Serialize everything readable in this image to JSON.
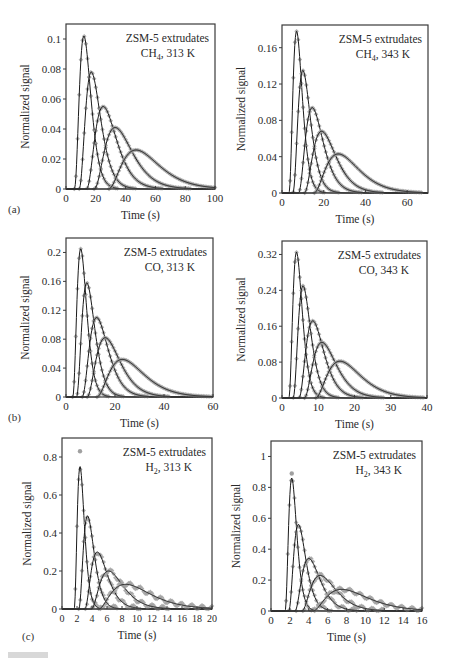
{
  "figure": {
    "panel_labels": [
      "(a)",
      "(b)",
      "(c)"
    ]
  },
  "chart_data": [
    {
      "id": "a-left",
      "type": "line",
      "title": "ZSM-5 extrudates",
      "subtitle": "CH4, 313 K",
      "subtitle_sub": "4",
      "subtitle_gas": "CH",
      "subtitle_temp": ", 313 K",
      "xlabel": "Time (s)",
      "ylabel": "Normalized signal",
      "xlim": [
        0,
        100
      ],
      "ylim": [
        0,
        0.11
      ],
      "xticks": [
        0,
        20,
        40,
        60,
        80,
        100
      ],
      "yticks": [
        0,
        0.02,
        0.04,
        0.06,
        0.08,
        0.1
      ],
      "ytick_labels": [
        "0",
        "0.02",
        "0.04",
        "0.06",
        "0.08",
        "0.1"
      ],
      "series_style": "markers (gray diamonds) = experiment, black line = model fit",
      "series": [
        {
          "name": "curve 1",
          "peak_x": 12,
          "peak_y": 0.102,
          "width": 4.5,
          "skew": 1.2
        },
        {
          "name": "curve 2",
          "peak_x": 17,
          "peak_y": 0.078,
          "width": 6,
          "skew": 1.3
        },
        {
          "name": "curve 3",
          "peak_x": 25,
          "peak_y": 0.055,
          "width": 8.5,
          "skew": 1.4
        },
        {
          "name": "curve 4",
          "peak_x": 33,
          "peak_y": 0.041,
          "width": 11,
          "skew": 1.5
        },
        {
          "name": "curve 5",
          "peak_x": 47,
          "peak_y": 0.026,
          "width": 15,
          "skew": 1.6
        }
      ],
      "frame": {
        "left": 66,
        "top": 24,
        "right": 215,
        "bottom": 189
      }
    },
    {
      "id": "a-right",
      "type": "line",
      "title": "ZSM-5 extrudates",
      "subtitle": "CH4, 343 K",
      "subtitle_sub": "4",
      "subtitle_gas": "CH",
      "subtitle_temp": ", 343 K",
      "xlabel": "Time (s)",
      "ylabel": "Normalized signal",
      "xlim": [
        0,
        70
      ],
      "ylim": [
        0,
        0.185
      ],
      "xticks": [
        0,
        20,
        40,
        60
      ],
      "yticks": [
        0,
        0.04,
        0.08,
        0.12,
        0.16
      ],
      "ytick_labels": [
        "0",
        "0.04",
        "0.08",
        "0.12",
        "0.16"
      ],
      "series": [
        {
          "name": "curve 1",
          "peak_x": 7,
          "peak_y": 0.178,
          "width": 2.6,
          "skew": 1.2
        },
        {
          "name": "curve 2",
          "peak_x": 10,
          "peak_y": 0.135,
          "width": 3.5,
          "skew": 1.3
        },
        {
          "name": "curve 3",
          "peak_x": 14.5,
          "peak_y": 0.094,
          "width": 5,
          "skew": 1.4
        },
        {
          "name": "curve 4",
          "peak_x": 19,
          "peak_y": 0.068,
          "width": 6.5,
          "skew": 1.5
        },
        {
          "name": "curve 5",
          "peak_x": 27,
          "peak_y": 0.043,
          "width": 9.5,
          "skew": 1.6
        }
      ],
      "frame": {
        "left": 282,
        "top": 25,
        "right": 428,
        "bottom": 193
      }
    },
    {
      "id": "b-left",
      "type": "line",
      "title": "ZSM-5 extrudates",
      "subtitle": "CO, 313 K",
      "subtitle_sub": "",
      "subtitle_gas": "CO",
      "subtitle_temp": ", 313 K",
      "xlabel": "Time (s)",
      "ylabel": "Normalized signal",
      "xlim": [
        0,
        60
      ],
      "ylim": [
        0,
        0.22
      ],
      "xticks": [
        0,
        20,
        40,
        60
      ],
      "yticks": [
        0,
        0.04,
        0.08,
        0.12,
        0.16,
        0.2
      ],
      "ytick_labels": [
        "0",
        "0.04",
        "0.08",
        "0.12",
        "0.16",
        "0.2"
      ],
      "series": [
        {
          "name": "curve 1",
          "peak_x": 6,
          "peak_y": 0.205,
          "width": 2.3,
          "skew": 1.2
        },
        {
          "name": "curve 2",
          "peak_x": 8.5,
          "peak_y": 0.158,
          "width": 3.1,
          "skew": 1.3
        },
        {
          "name": "curve 3",
          "peak_x": 12.5,
          "peak_y": 0.11,
          "width": 4.5,
          "skew": 1.4
        },
        {
          "name": "curve 4",
          "peak_x": 16,
          "peak_y": 0.082,
          "width": 5.8,
          "skew": 1.5
        },
        {
          "name": "curve 5",
          "peak_x": 23,
          "peak_y": 0.052,
          "width": 8.5,
          "skew": 1.6
        }
      ],
      "frame": {
        "left": 66,
        "top": 238,
        "right": 213,
        "bottom": 397
      }
    },
    {
      "id": "b-right",
      "type": "line",
      "title": "ZSM-5 extrudates",
      "subtitle": "CO, 343 K",
      "subtitle_sub": "",
      "subtitle_gas": "CO",
      "subtitle_temp": ", 343 K",
      "xlabel": "Time (s)",
      "ylabel": "Normalized signal",
      "xlim": [
        0,
        40
      ],
      "ylim": [
        0,
        0.35
      ],
      "xticks": [
        0,
        10,
        20,
        30,
        40
      ],
      "yticks": [
        0,
        0.08,
        0.16,
        0.24,
        0.32
      ],
      "ytick_labels": [
        "0",
        "0.08",
        "0.16",
        "0.24",
        "0.32"
      ],
      "series": [
        {
          "name": "curve 1",
          "peak_x": 4,
          "peak_y": 0.325,
          "width": 1.5,
          "skew": 1.2
        },
        {
          "name": "curve 2",
          "peak_x": 5.8,
          "peak_y": 0.25,
          "width": 2,
          "skew": 1.3
        },
        {
          "name": "curve 3",
          "peak_x": 8.5,
          "peak_y": 0.172,
          "width": 2.9,
          "skew": 1.4
        },
        {
          "name": "curve 4",
          "peak_x": 11,
          "peak_y": 0.124,
          "width": 3.8,
          "skew": 1.5
        },
        {
          "name": "curve 5",
          "peak_x": 16,
          "peak_y": 0.082,
          "width": 5.5,
          "skew": 1.6
        }
      ],
      "frame": {
        "left": 282,
        "top": 241,
        "right": 427,
        "bottom": 398
      }
    },
    {
      "id": "c-left",
      "type": "line",
      "title": "ZSM-5 extrudates",
      "subtitle": "H2, 313 K",
      "subtitle_sub": "2",
      "subtitle_gas": "H",
      "subtitle_temp": ", 313 K",
      "xlabel": "Time (s)",
      "ylabel": "Normalized signal",
      "xlim": [
        0,
        20
      ],
      "ylim": [
        0,
        0.9
      ],
      "xticks": [
        0,
        2,
        4,
        6,
        8,
        10,
        12,
        14,
        16,
        18,
        20
      ],
      "yticks": [
        0,
        0.2,
        0.4,
        0.6,
        0.8
      ],
      "ytick_labels": [
        "0",
        "0.2",
        "0.4",
        "0.6",
        "0.8"
      ],
      "series": [
        {
          "name": "curve 1",
          "peak_x": 2.4,
          "peak_y": 0.75,
          "width": 0.55,
          "skew": 1.2,
          "outlier_y": 0.83
        },
        {
          "name": "curve 2",
          "peak_x": 3.4,
          "peak_y": 0.49,
          "width": 0.85,
          "skew": 1.3
        },
        {
          "name": "curve 3",
          "peak_x": 4.7,
          "peak_y": 0.3,
          "width": 1.3,
          "skew": 1.5
        },
        {
          "name": "curve 4",
          "peak_x": 6.2,
          "peak_y": 0.2,
          "width": 1.9,
          "skew": 1.7
        },
        {
          "name": "curve 5",
          "peak_x": 8.5,
          "peak_y": 0.13,
          "width": 3.2,
          "skew": 1.9
        }
      ],
      "frame": {
        "left": 62,
        "top": 438,
        "right": 212,
        "bottom": 609
      }
    },
    {
      "id": "c-right",
      "type": "line",
      "title": "ZSM-5 extrudates",
      "subtitle": "H2, 343 K",
      "subtitle_sub": "2",
      "subtitle_gas": "H",
      "subtitle_temp": ", 343 K",
      "xlabel": "Time (s)",
      "ylabel": "Normalized signal",
      "xlim": [
        0,
        16
      ],
      "ylim": [
        0,
        1.1
      ],
      "xticks": [
        0,
        2,
        4,
        6,
        8,
        10,
        12,
        14,
        16
      ],
      "yticks": [
        0,
        0.2,
        0.4,
        0.6,
        0.8,
        1
      ],
      "ytick_labels": [
        "0",
        "0.2",
        "0.4",
        "0.6",
        "0.8",
        "1"
      ],
      "series": [
        {
          "name": "curve 1",
          "peak_x": 2.2,
          "peak_y": 0.86,
          "width": 0.5,
          "skew": 1.2,
          "outlier_y": 0.89
        },
        {
          "name": "curve 2",
          "peak_x": 2.9,
          "peak_y": 0.56,
          "width": 0.75,
          "skew": 1.3
        },
        {
          "name": "curve 3",
          "peak_x": 4,
          "peak_y": 0.34,
          "width": 1.15,
          "skew": 1.5
        },
        {
          "name": "curve 4",
          "peak_x": 5.2,
          "peak_y": 0.23,
          "width": 1.6,
          "skew": 1.7
        },
        {
          "name": "curve 5",
          "peak_x": 7.5,
          "peak_y": 0.14,
          "width": 2.7,
          "skew": 1.9
        }
      ],
      "frame": {
        "left": 271,
        "top": 441,
        "right": 422,
        "bottom": 611
      }
    }
  ],
  "colors": {
    "frame": "#3a3a3a",
    "fit_line": "#1a1a1a",
    "markers": "#a0a0a0",
    "text": "#2a2a2a"
  }
}
